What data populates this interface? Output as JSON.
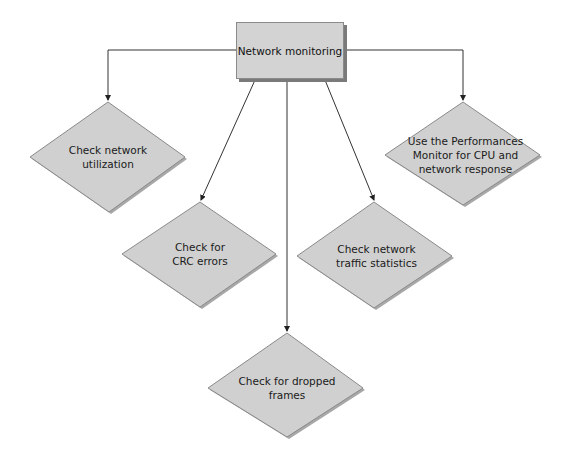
{
  "diagram": {
    "type": "flowchart",
    "colors": {
      "node_fill": "#d0d0d0",
      "node_stroke": "#8a8a8a",
      "shadow": "#9a9a9a",
      "line": "#333333"
    },
    "root": {
      "label": "Network monitoring"
    },
    "nodes": [
      {
        "id": "n1",
        "label_lines": [
          "Check network",
          "utilization"
        ]
      },
      {
        "id": "n2",
        "label_lines": [
          "Check for",
          "CRC errors"
        ]
      },
      {
        "id": "n3",
        "label_lines": [
          "Check for dropped",
          "frames"
        ]
      },
      {
        "id": "n4",
        "label_lines": [
          "Check network",
          "traffic statistics"
        ]
      },
      {
        "id": "n5",
        "label_lines": [
          "Use the Performances",
          "Monitor for CPU and",
          "network response"
        ]
      }
    ],
    "edges": [
      {
        "from": "root",
        "to": "n1"
      },
      {
        "from": "root",
        "to": "n2"
      },
      {
        "from": "root",
        "to": "n3"
      },
      {
        "from": "root",
        "to": "n4"
      },
      {
        "from": "root",
        "to": "n5"
      }
    ]
  }
}
